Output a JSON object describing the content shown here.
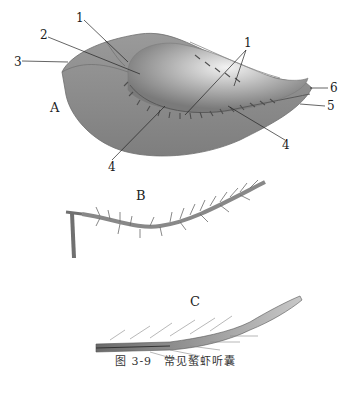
{
  "figure": {
    "caption": {
      "number": "图 3-9",
      "title": "常见螯虾听囊"
    },
    "panels": [
      {
        "id": "A",
        "label": "A"
      },
      {
        "id": "B",
        "label": "B"
      },
      {
        "id": "C",
        "label": "C"
      }
    ],
    "callouts": [
      {
        "text": "1",
        "x": 76,
        "y": 12
      },
      {
        "text": "2",
        "x": 40,
        "y": 29
      },
      {
        "text": "3",
        "x": 14,
        "y": 56
      },
      {
        "text": "1",
        "x": 244,
        "y": 37
      },
      {
        "text": "6",
        "x": 330,
        "y": 82
      },
      {
        "text": "5",
        "x": 327,
        "y": 100
      },
      {
        "text": "A",
        "x": 50,
        "y": 101
      },
      {
        "text": "4",
        "x": 282,
        "y": 139
      },
      {
        "text": "4",
        "x": 108,
        "y": 161
      }
    ],
    "colors": {
      "tissue": "#8a8a8a",
      "tissue_light": "#d8d8d8",
      "setae": "#5a5a5a",
      "background": "#ffffff"
    }
  }
}
